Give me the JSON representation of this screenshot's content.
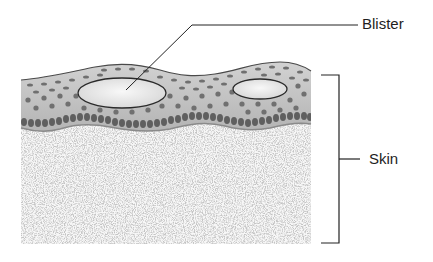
{
  "diagram": {
    "type": "anatomical-cross-section",
    "labels": {
      "blister": "Blister",
      "skin": "Skin"
    },
    "colors": {
      "background": "#ffffff",
      "epidermis_fill": "#bdbdbd",
      "epidermis_outline": "#4a4a4a",
      "cell_dots": "#7a7a7a",
      "basal_cells": "#6e6e6e",
      "blister_fill": "#ececec",
      "dermis_speckle": "#c8c8c8",
      "leader_line": "#222222"
    },
    "structures": [
      {
        "name": "epidermis",
        "description": "Wavy upper layer with dotted cells"
      },
      {
        "name": "blister-large",
        "description": "Fluid-filled oval in epidermis (labeled)"
      },
      {
        "name": "blister-small",
        "description": "Smaller fluid-filled oval in epidermis"
      },
      {
        "name": "basal-layer",
        "description": "Dense row of dark cells at bottom of epidermis"
      },
      {
        "name": "dermis",
        "description": "Speckled lower layer"
      },
      {
        "name": "skin-bracket",
        "description": "Bracket spanning full skin thickness"
      }
    ]
  }
}
